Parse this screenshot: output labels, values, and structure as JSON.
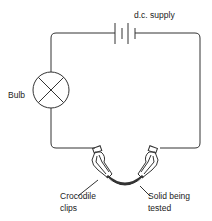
{
  "diagram": {
    "type": "circuit",
    "labels": {
      "supply": "d.c. supply",
      "bulb": "Bulb",
      "clips_line1": "Crocodile",
      "clips_line2": "clips",
      "solid_line1": "Solid being",
      "solid_line2": "tested"
    },
    "components": [
      "dc-supply-battery",
      "bulb",
      "crocodile-clip-left",
      "crocodile-clip-right",
      "solid-sample"
    ],
    "colors": {
      "line": "#333333",
      "background": "#ffffff"
    }
  }
}
